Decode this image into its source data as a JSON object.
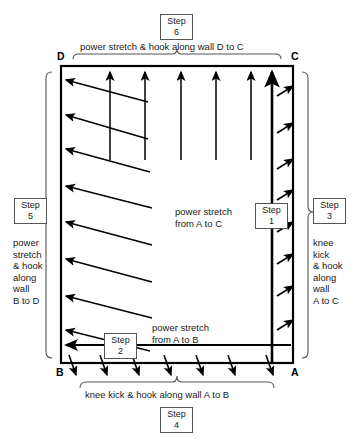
{
  "diagram": {
    "title_hidden": "",
    "corners": {
      "top_left": "D",
      "top_right": "C",
      "bottom_left": "B",
      "bottom_right": "A"
    },
    "steps": [
      {
        "id": "step1",
        "box_label": "Step",
        "number": "1",
        "description": "power stretch from A to C",
        "description_lines": [
          "power stretch",
          "from A to C"
        ]
      },
      {
        "id": "step2",
        "box_label": "Step",
        "number": "2",
        "description": "power stretch from A to B",
        "description_lines": [
          "power stretch",
          "from A to B"
        ]
      },
      {
        "id": "step3",
        "box_label": "Step",
        "number": "3",
        "description": "knee kick & hook along wall A to C",
        "description_lines": [
          "knee",
          "kick",
          "& hook",
          "along",
          "wall",
          "A to C"
        ]
      },
      {
        "id": "step4",
        "box_label": "Step",
        "number": "4",
        "description": "knee kick & hook along wall A to B",
        "description_lines": [
          "knee kick & hook along wall A to B"
        ]
      },
      {
        "id": "step5",
        "box_label": "Step",
        "number": "5",
        "description": "power stretch & hook along wall B to D",
        "description_lines": [
          "power",
          "stretch",
          "& hook",
          "along",
          "wall",
          "B to D"
        ]
      },
      {
        "id": "step6",
        "box_label": "Step",
        "number": "6",
        "description": "power stretch & hook along wall D to C",
        "description_lines": [
          "power stretch & hook along wall D to C"
        ]
      }
    ],
    "labels": {
      "top_brace_text": "power stretch & hook along wall D to C",
      "bottom_brace_text": "knee kick & hook along wall A to B",
      "center_step1_line1": "power stretch",
      "center_step1_line2": "from A to C",
      "center_step2_line1": "power stretch",
      "center_step2_line2": "from A to B",
      "left_block": "power\nstretch\n& hook\nalong\nwall\nB to D",
      "right_block": "knee\nkick\n& hook\nalong\nwall\nA to C"
    },
    "colors": {
      "stroke": "#000000",
      "box_border": "#555555",
      "brace": "#555555",
      "background": "#ffffff"
    },
    "arrow_groups": {
      "top_vertical_up": 6,
      "right_wall_diagonal": 8,
      "left_wall_diagonal": 8,
      "bottom_wall_diagonal": 7,
      "long_diagonals_to_left_wall": 9
    }
  }
}
